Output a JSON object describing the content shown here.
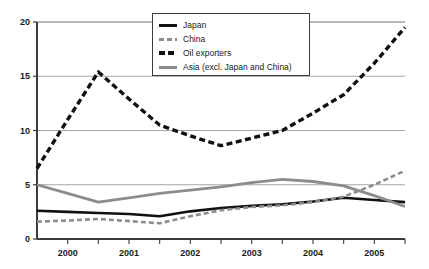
{
  "chart_data": {
    "type": "line",
    "title": "",
    "subtitle": "",
    "xlabel": "",
    "ylabel": "",
    "xlim": [
      1999.5,
      2005.5
    ],
    "ylim": [
      0,
      20
    ],
    "yticks": [
      0,
      5,
      10,
      15,
      20
    ],
    "ytick_labels": [
      "0",
      "5",
      "10",
      "15",
      "20"
    ],
    "xticks": [
      2000,
      2001,
      2002,
      2003,
      2004,
      2005
    ],
    "xtick_labels": [
      "2000",
      "2001",
      "2002",
      "2003",
      "2004",
      "2005"
    ],
    "x": [
      1999.5,
      2000.0,
      2000.5,
      2001.0,
      2001.5,
      2002.0,
      2002.5,
      2003.0,
      2003.5,
      2004.0,
      2004.5,
      2005.0,
      2005.5
    ],
    "grid": true,
    "grid_axis": "y",
    "legend_position": "top-center",
    "series": [
      {
        "name": "Japan",
        "color": "#111111",
        "style": "solid",
        "width": 2.6,
        "values": [
          2.6,
          2.5,
          2.4,
          2.3,
          2.1,
          2.55,
          2.85,
          3.05,
          3.2,
          3.45,
          3.8,
          3.6,
          3.4
        ]
      },
      {
        "name": "China",
        "color": "#8c8c8c",
        "style": "dashed",
        "width": 2.6,
        "values": [
          1.6,
          1.7,
          1.85,
          1.65,
          1.45,
          2.1,
          2.65,
          2.95,
          3.1,
          3.4,
          3.9,
          5.0,
          6.3
        ]
      },
      {
        "name": "Oil exporters",
        "color": "#111111",
        "style": "dashed",
        "width": 3.4,
        "values": [
          6.5,
          11.0,
          15.4,
          12.9,
          10.5,
          9.5,
          8.6,
          9.3,
          10.0,
          11.6,
          13.3,
          16.2,
          19.5
        ]
      },
      {
        "name": "Asia (excl. Japan and China)",
        "color": "#8c8c8c",
        "style": "solid",
        "width": 2.8,
        "values": [
          5.0,
          4.2,
          3.4,
          3.8,
          4.2,
          4.5,
          4.8,
          5.2,
          5.5,
          5.3,
          4.9,
          4.0,
          3.0
        ]
      }
    ]
  },
  "legend": {
    "items": [
      {
        "label": "Japan"
      },
      {
        "label": "China"
      },
      {
        "label": "Oil exporters"
      },
      {
        "label": "Asia (excl. Japan and China)"
      }
    ]
  },
  "colors": {
    "black": "#111111",
    "gray": "#8c8c8c",
    "axis": "#3b3b3b",
    "grid": "#9a9a9a",
    "background": "#ffffff"
  }
}
